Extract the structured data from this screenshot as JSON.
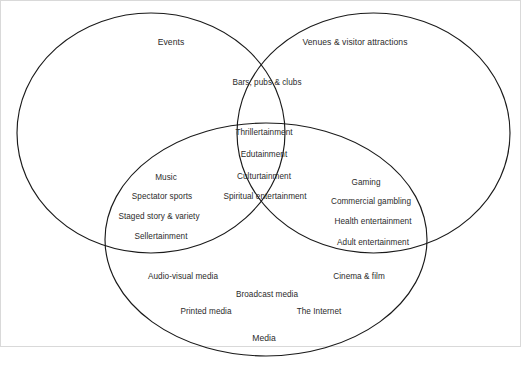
{
  "figure": {
    "type": "venn-diagram",
    "set_count": 3,
    "background_color": "#ffffff",
    "stroke_color": "#1a1a1a",
    "text_color": "#2b2b2b",
    "frame_color": "#d9d9d9"
  },
  "sets": {
    "events": {
      "label": "Events"
    },
    "venues": {
      "label": "Venues & visitor attractions"
    },
    "media": {
      "label": "Media"
    }
  },
  "regions": {
    "events_venues": {
      "name": "Events and Venues overlap",
      "items": [
        "Bars, pubs & clubs"
      ]
    },
    "events_venues_media": {
      "name": "All three overlap",
      "items": [
        "Thrillertainment",
        "Edutainment",
        "Culturtainment",
        "Spiritual entertainment"
      ]
    },
    "events_media": {
      "name": "Events and Media overlap",
      "items": [
        "Music",
        "Spectator sports",
        "Staged story & variety",
        "Sellertainment"
      ]
    },
    "venues_media": {
      "name": "Venues and Media overlap",
      "items": [
        "Gaming",
        "Commercial gambling",
        "Health entertainment",
        "Adult entertainment"
      ]
    },
    "media_only": {
      "name": "Media only",
      "items": [
        "Audio-visual media",
        "Cinema & film",
        "Broadcast media",
        "Printed media",
        "The Internet"
      ]
    }
  }
}
